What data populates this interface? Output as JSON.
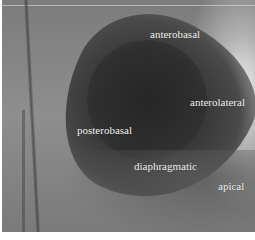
{
  "image": {
    "description": "Left ventriculogram (X-ray angiography) with anatomical wall segment labels",
    "labels": {
      "anterobasal": "anterobasal",
      "anterolateral": "anterolateral",
      "posterobasal": "posterobasal",
      "diaphragmatic": "diaphragmatic",
      "apical": "apical"
    }
  }
}
